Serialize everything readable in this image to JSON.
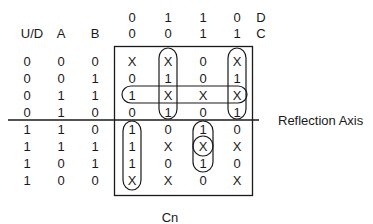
{
  "header": {
    "col_labels": {
      "ud": "U/D",
      "a": "A",
      "b": "B"
    },
    "d_row": [
      "0",
      "1",
      "1",
      "0"
    ],
    "c_row": [
      "0",
      "0",
      "1",
      "1"
    ],
    "d_label": "D",
    "c_label": "C"
  },
  "rows": [
    {
      "ud": "0",
      "a": "0",
      "b": "0",
      "cells": [
        "X",
        "X",
        "0",
        "X"
      ]
    },
    {
      "ud": "0",
      "a": "0",
      "b": "1",
      "cells": [
        "0",
        "1",
        "0",
        "1"
      ]
    },
    {
      "ud": "0",
      "a": "1",
      "b": "1",
      "cells": [
        "1",
        "X",
        "X",
        "X"
      ]
    },
    {
      "ud": "0",
      "a": "1",
      "b": "0",
      "cells": [
        "0",
        "1",
        "0",
        "1"
      ]
    },
    {
      "ud": "1",
      "a": "1",
      "b": "0",
      "cells": [
        "1",
        "0",
        "1",
        "0"
      ]
    },
    {
      "ud": "1",
      "a": "1",
      "b": "1",
      "cells": [
        "1",
        "X",
        "X",
        "X"
      ]
    },
    {
      "ud": "1",
      "a": "0",
      "b": "1",
      "cells": [
        "1",
        "0",
        "1",
        "0"
      ]
    },
    {
      "ud": "1",
      "a": "0",
      "b": "0",
      "cells": [
        "X",
        "X",
        "0",
        "X"
      ]
    }
  ],
  "annotations": {
    "reflection_axis": "Reflection Axis",
    "output_label": "Cn"
  },
  "groupings": [
    {
      "type": "vertical-loop",
      "column": 1,
      "rows": [
        0,
        3
      ]
    },
    {
      "type": "vertical-loop",
      "column": 3,
      "rows": [
        0,
        3
      ]
    },
    {
      "type": "horizontal-loop",
      "row": 2,
      "columns": [
        0,
        3
      ]
    },
    {
      "type": "vertical-loop",
      "column": 0,
      "rows": [
        4,
        7
      ]
    },
    {
      "type": "vertical-loop",
      "column": 2,
      "rows": [
        4,
        6
      ]
    },
    {
      "type": "circle",
      "column": 2,
      "row": 5
    }
  ],
  "colors": {
    "ink": "#1a1a1a",
    "background": "#ffffff"
  }
}
